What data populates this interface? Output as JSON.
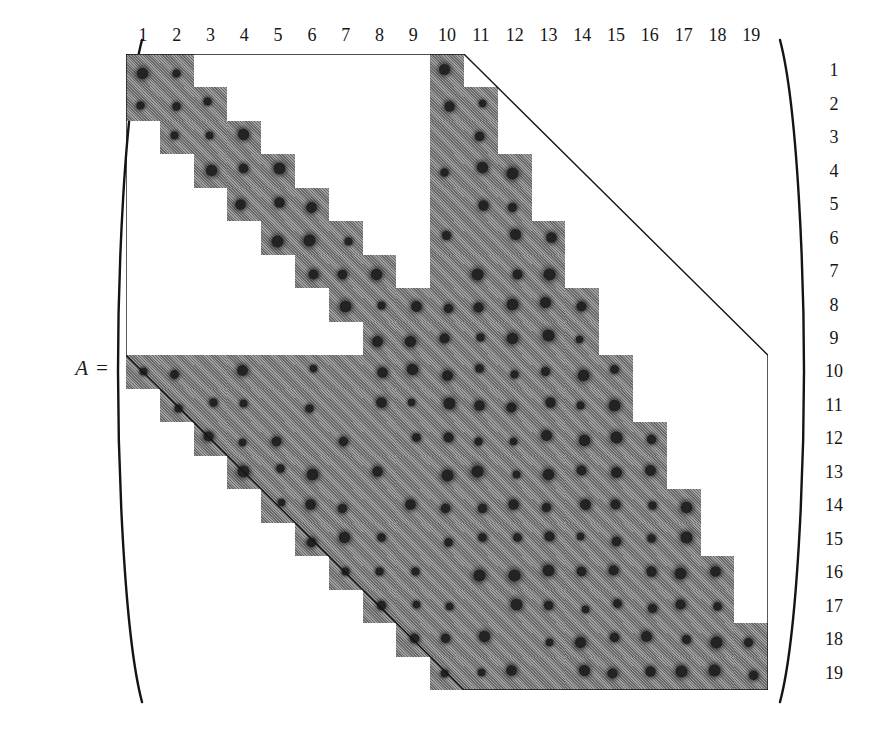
{
  "figure": {
    "label": "A =",
    "matrix_name": "A",
    "order": 19
  },
  "axes": {
    "column_labels": [
      "1",
      "2",
      "3",
      "4",
      "5",
      "6",
      "7",
      "8",
      "9",
      "10",
      "11",
      "12",
      "13",
      "14",
      "15",
      "16",
      "17",
      "18",
      "19"
    ],
    "row_labels": [
      "1",
      "2",
      "3",
      "4",
      "5",
      "6",
      "7",
      "8",
      "9",
      "10",
      "11",
      "12",
      "13",
      "14",
      "15",
      "16",
      "17",
      "18",
      "19"
    ]
  },
  "colors": {
    "fill": "#8a8a8a",
    "nonzero": "#232323",
    "outline": "#141414",
    "background": "#ffffff",
    "text": "#161616"
  },
  "chart_data": {
    "type": "heatmap",
    "title": "",
    "xlabel": "",
    "ylabel": "",
    "n_rows": 19,
    "n_cols": 19,
    "legend": [],
    "grid": false,
    "envelope_note": "Thin polyline traces the skyline/profile envelope of the band",
    "row_bands": [
      {
        "row": 1,
        "segments": [
          [
            1,
            2
          ],
          [
            10,
            10
          ]
        ]
      },
      {
        "row": 2,
        "segments": [
          [
            1,
            3
          ],
          [
            10,
            11
          ]
        ]
      },
      {
        "row": 3,
        "segments": [
          [
            2,
            4
          ],
          [
            10,
            11
          ]
        ]
      },
      {
        "row": 4,
        "segments": [
          [
            3,
            5
          ],
          [
            10,
            12
          ]
        ]
      },
      {
        "row": 5,
        "segments": [
          [
            4,
            6
          ],
          [
            10,
            12
          ]
        ]
      },
      {
        "row": 6,
        "segments": [
          [
            5,
            7
          ],
          [
            10,
            13
          ]
        ]
      },
      {
        "row": 7,
        "segments": [
          [
            6,
            8
          ],
          [
            10,
            13
          ]
        ]
      },
      {
        "row": 8,
        "segments": [
          [
            7,
            14
          ]
        ]
      },
      {
        "row": 9,
        "segments": [
          [
            8,
            14
          ]
        ]
      },
      {
        "row": 10,
        "segments": [
          [
            1,
            15
          ]
        ]
      },
      {
        "row": 11,
        "segments": [
          [
            2,
            15
          ]
        ]
      },
      {
        "row": 12,
        "segments": [
          [
            3,
            16
          ]
        ]
      },
      {
        "row": 13,
        "segments": [
          [
            4,
            16
          ]
        ]
      },
      {
        "row": 14,
        "segments": [
          [
            5,
            17
          ]
        ]
      },
      {
        "row": 15,
        "segments": [
          [
            6,
            17
          ]
        ]
      },
      {
        "row": 16,
        "segments": [
          [
            7,
            18
          ]
        ]
      },
      {
        "row": 17,
        "segments": [
          [
            8,
            18
          ]
        ]
      },
      {
        "row": 18,
        "segments": [
          [
            9,
            19
          ]
        ]
      },
      {
        "row": 19,
        "segments": [
          [
            10,
            19
          ]
        ]
      }
    ],
    "nonzeros": [
      [
        1,
        1
      ],
      [
        1,
        2
      ],
      [
        1,
        10
      ],
      [
        2,
        1
      ],
      [
        2,
        2
      ],
      [
        2,
        3
      ],
      [
        2,
        10
      ],
      [
        2,
        11
      ],
      [
        3,
        2
      ],
      [
        3,
        3
      ],
      [
        3,
        4
      ],
      [
        3,
        11
      ],
      [
        4,
        3
      ],
      [
        4,
        4
      ],
      [
        4,
        5
      ],
      [
        4,
        10
      ],
      [
        4,
        11
      ],
      [
        4,
        12
      ],
      [
        5,
        4
      ],
      [
        5,
        5
      ],
      [
        5,
        6
      ],
      [
        5,
        11
      ],
      [
        5,
        12
      ],
      [
        6,
        5
      ],
      [
        6,
        6
      ],
      [
        6,
        7
      ],
      [
        6,
        10
      ],
      [
        6,
        12
      ],
      [
        6,
        13
      ],
      [
        7,
        6
      ],
      [
        7,
        7
      ],
      [
        7,
        8
      ],
      [
        7,
        11
      ],
      [
        7,
        12
      ],
      [
        7,
        13
      ],
      [
        8,
        7
      ],
      [
        8,
        8
      ],
      [
        8,
        9
      ],
      [
        8,
        10
      ],
      [
        8,
        11
      ],
      [
        8,
        12
      ],
      [
        8,
        13
      ],
      [
        8,
        14
      ],
      [
        9,
        8
      ],
      [
        9,
        9
      ],
      [
        9,
        10
      ],
      [
        9,
        11
      ],
      [
        9,
        12
      ],
      [
        9,
        13
      ],
      [
        9,
        14
      ],
      [
        10,
        1
      ],
      [
        10,
        2
      ],
      [
        10,
        4
      ],
      [
        10,
        6
      ],
      [
        10,
        8
      ],
      [
        10,
        9
      ],
      [
        10,
        10
      ],
      [
        10,
        11
      ],
      [
        10,
        12
      ],
      [
        10,
        13
      ],
      [
        10,
        14
      ],
      [
        10,
        15
      ],
      [
        11,
        2
      ],
      [
        11,
        3
      ],
      [
        11,
        4
      ],
      [
        11,
        6
      ],
      [
        11,
        8
      ],
      [
        11,
        9
      ],
      [
        11,
        10
      ],
      [
        11,
        11
      ],
      [
        11,
        12
      ],
      [
        11,
        13
      ],
      [
        11,
        14
      ],
      [
        11,
        15
      ],
      [
        12,
        3
      ],
      [
        12,
        4
      ],
      [
        12,
        5
      ],
      [
        12,
        7
      ],
      [
        12,
        9
      ],
      [
        12,
        10
      ],
      [
        12,
        11
      ],
      [
        12,
        12
      ],
      [
        12,
        13
      ],
      [
        12,
        14
      ],
      [
        12,
        15
      ],
      [
        12,
        16
      ],
      [
        13,
        4
      ],
      [
        13,
        5
      ],
      [
        13,
        6
      ],
      [
        13,
        8
      ],
      [
        13,
        10
      ],
      [
        13,
        11
      ],
      [
        13,
        12
      ],
      [
        13,
        13
      ],
      [
        13,
        14
      ],
      [
        13,
        15
      ],
      [
        13,
        16
      ],
      [
        14,
        5
      ],
      [
        14,
        6
      ],
      [
        14,
        7
      ],
      [
        14,
        9
      ],
      [
        14,
        10
      ],
      [
        14,
        11
      ],
      [
        14,
        12
      ],
      [
        14,
        13
      ],
      [
        14,
        14
      ],
      [
        14,
        15
      ],
      [
        14,
        16
      ],
      [
        14,
        17
      ],
      [
        15,
        6
      ],
      [
        15,
        7
      ],
      [
        15,
        8
      ],
      [
        15,
        10
      ],
      [
        15,
        11
      ],
      [
        15,
        12
      ],
      [
        15,
        13
      ],
      [
        15,
        14
      ],
      [
        15,
        15
      ],
      [
        15,
        16
      ],
      [
        15,
        17
      ],
      [
        16,
        7
      ],
      [
        16,
        8
      ],
      [
        16,
        9
      ],
      [
        16,
        11
      ],
      [
        16,
        12
      ],
      [
        16,
        13
      ],
      [
        16,
        14
      ],
      [
        16,
        15
      ],
      [
        16,
        16
      ],
      [
        16,
        17
      ],
      [
        16,
        18
      ],
      [
        17,
        8
      ],
      [
        17,
        9
      ],
      [
        17,
        10
      ],
      [
        17,
        12
      ],
      [
        17,
        13
      ],
      [
        17,
        14
      ],
      [
        17,
        15
      ],
      [
        17,
        16
      ],
      [
        17,
        17
      ],
      [
        17,
        18
      ],
      [
        18,
        9
      ],
      [
        18,
        10
      ],
      [
        18,
        11
      ],
      [
        18,
        13
      ],
      [
        18,
        14
      ],
      [
        18,
        15
      ],
      [
        18,
        16
      ],
      [
        18,
        17
      ],
      [
        18,
        18
      ],
      [
        18,
        19
      ],
      [
        19,
        10
      ],
      [
        19,
        11
      ],
      [
        19,
        12
      ],
      [
        19,
        14
      ],
      [
        19,
        15
      ],
      [
        19,
        16
      ],
      [
        19,
        17
      ],
      [
        19,
        18
      ],
      [
        19,
        19
      ]
    ],
    "envelope_path": [
      [
        0,
        0
      ],
      [
        10,
        0
      ],
      [
        11,
        1
      ],
      [
        19,
        9
      ],
      [
        19,
        19
      ],
      [
        10,
        19
      ],
      [
        9,
        18
      ],
      [
        0,
        9
      ],
      [
        0,
        0
      ]
    ]
  }
}
